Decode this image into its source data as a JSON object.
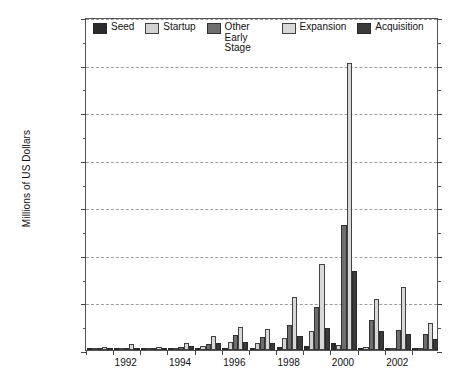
{
  "chart_data": {
    "type": "bar",
    "title": "",
    "xlabel": "",
    "ylabel": "Millions of US Dollars",
    "ylim": [
      0,
      70000
    ],
    "ytick_step": 10000,
    "yticks": [
      "0",
      "10,000",
      "20,000",
      "30,000",
      "40,000",
      "50,000",
      "60,000",
      "70,000"
    ],
    "grid": true,
    "grid_axis": "y",
    "legend_position": "top-inside-left",
    "categories": [
      "1991",
      "1992",
      "1993",
      "1994",
      "1995",
      "1996",
      "1997",
      "1998",
      "1999",
      "2000",
      "2001",
      "2002",
      "2003"
    ],
    "xtick_labels": [
      "1992",
      "1994",
      "1996",
      "1998",
      "2000",
      "2002"
    ],
    "series": [
      {
        "name": "Seed",
        "color": "#2b2b2b",
        "values": [
          180,
          170,
          150,
          210,
          300,
          500,
          450,
          700,
          900,
          1500,
          350,
          200,
          180
        ]
      },
      {
        "name": "Startup",
        "color": "#d2d2d2",
        "values": [
          380,
          330,
          380,
          520,
          900,
          1700,
          1500,
          2500,
          3900,
          1100,
          700,
          400,
          300
        ]
      },
      {
        "name": "Other Early Stage",
        "color": "#6e6e6e",
        "values": [
          260,
          420,
          350,
          700,
          1200,
          3100,
          2800,
          5300,
          9000,
          26200,
          6300,
          4200,
          3400
        ]
      },
      {
        "name": "Expansion",
        "color": "#d8d8d8",
        "values": [
          550,
          1350,
          600,
          1500,
          2900,
          4800,
          4500,
          11200,
          18000,
          60400,
          10800,
          13300,
          5600
        ]
      },
      {
        "name": "Acquisition",
        "color": "#3a3a3a",
        "values": [
          300,
          520,
          400,
          800,
          1400,
          1600,
          1500,
          2900,
          4700,
          16700,
          4100,
          3300,
          2400
        ]
      }
    ]
  },
  "legend": {
    "items": [
      {
        "label": "Seed",
        "color": "#2b2b2b"
      },
      {
        "label": "Startup",
        "color": "#d2d2d2"
      },
      {
        "label": "Other Early Stage",
        "color": "#6e6e6e"
      },
      {
        "label": "Expansion",
        "color": "#d8d8d8"
      },
      {
        "label": "Acquisition",
        "color": "#3a3a3a"
      }
    ]
  },
  "axes": {
    "y_title": "Millions of US Dollars"
  }
}
